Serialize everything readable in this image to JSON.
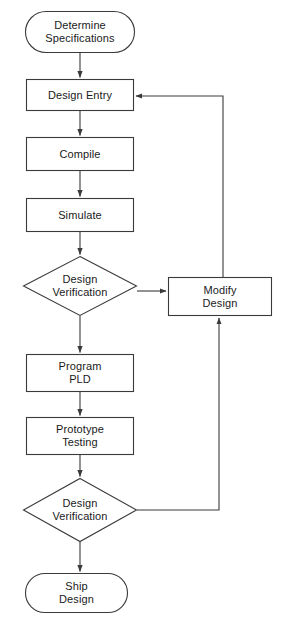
{
  "diagram": {
    "type": "flowchart",
    "orientation": "top-to-bottom",
    "background_color": "#ffffff",
    "line_color": "#3a3a3a",
    "text_color": "#1a1a1a",
    "nodes": [
      {
        "id": "determine-specifications",
        "label": "Determine\nSpecifications",
        "shape": "terminator",
        "x": 25,
        "y": 11,
        "w": 110,
        "h": 42
      },
      {
        "id": "design-entry",
        "label": "Design Entry",
        "shape": "process",
        "x": 26,
        "y": 79,
        "w": 108,
        "h": 32
      },
      {
        "id": "compile",
        "label": "Compile",
        "shape": "process",
        "x": 26,
        "y": 137,
        "w": 108,
        "h": 34
      },
      {
        "id": "simulate",
        "label": "Simulate",
        "shape": "process",
        "x": 26,
        "y": 198,
        "w": 108,
        "h": 34
      },
      {
        "id": "design-verification-1",
        "label": "Design\nVerification",
        "shape": "decision",
        "x": 23,
        "y": 256,
        "w": 114,
        "h": 60
      },
      {
        "id": "modify-design",
        "label": "Modify\nDesign",
        "shape": "process",
        "x": 168,
        "y": 277,
        "w": 104,
        "h": 39
      },
      {
        "id": "program-pld",
        "label": "Program\nPLD",
        "shape": "process",
        "x": 26,
        "y": 354,
        "w": 108,
        "h": 38
      },
      {
        "id": "prototype-testing",
        "label": "Prototype\nTesting",
        "shape": "process",
        "x": 26,
        "y": 417,
        "w": 108,
        "h": 38
      },
      {
        "id": "design-verification-2",
        "label": "Design\nVerification",
        "shape": "decision",
        "x": 23,
        "y": 478,
        "w": 114,
        "h": 64
      },
      {
        "id": "ship-design",
        "label": "Ship\nDesign",
        "shape": "terminator",
        "x": 25,
        "y": 573,
        "w": 103,
        "h": 40
      }
    ],
    "edges": [
      {
        "id": "edge-specs-to-entry",
        "from": "determine-specifications",
        "to": "design-entry",
        "kind": "straight-down"
      },
      {
        "id": "edge-entry-to-compile",
        "from": "design-entry",
        "to": "compile",
        "kind": "straight-down"
      },
      {
        "id": "edge-compile-to-simulate",
        "from": "compile",
        "to": "simulate",
        "kind": "straight-down"
      },
      {
        "id": "edge-simulate-to-verify1",
        "from": "simulate",
        "to": "design-verification-1",
        "kind": "straight-down"
      },
      {
        "id": "edge-verify1-to-modify",
        "from": "design-verification-1",
        "to": "modify-design",
        "kind": "right-branch"
      },
      {
        "id": "edge-verify1-to-program",
        "from": "design-verification-1",
        "to": "program-pld",
        "kind": "straight-down"
      },
      {
        "id": "edge-modify-to-entry",
        "from": "modify-design",
        "to": "design-entry",
        "kind": "feedback-up-left"
      },
      {
        "id": "edge-program-to-prototype",
        "from": "program-pld",
        "to": "prototype-testing",
        "kind": "straight-down"
      },
      {
        "id": "edge-prototype-to-verify2",
        "from": "prototype-testing",
        "to": "design-verification-2",
        "kind": "straight-down"
      },
      {
        "id": "edge-verify2-to-modify",
        "from": "design-verification-2",
        "to": "modify-design",
        "kind": "right-branch-up"
      },
      {
        "id": "edge-verify2-to-ship",
        "from": "design-verification-2",
        "to": "ship-design",
        "kind": "straight-down"
      }
    ]
  }
}
